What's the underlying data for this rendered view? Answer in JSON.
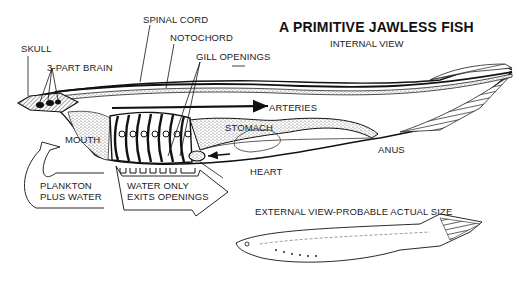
{
  "title": "A PRIMITIVE JAWLESS FISH",
  "subtitle": "INTERNAL VIEW",
  "labels": {
    "spinal_cord": "SPINAL CORD",
    "notochord": "NOTOCHORD",
    "skull": "SKULL",
    "brain": "3-PART BRAIN",
    "gill_openings": "GILL OPENINGS",
    "arteries": "ARTERIES",
    "mouth": "MOUTH",
    "stomach": "STOMACH",
    "heart": "HEART",
    "anus": "ANUS",
    "plankton_line1": "PLANKTON",
    "plankton_line2": "PLUS WATER",
    "water_line1": "WATER ONLY",
    "water_line2": "EXITS OPENINGS",
    "external_view": "EXTERNAL VIEW-PROBABLE ACTUAL SIZE"
  },
  "colors": {
    "ink": "#1a1a1a",
    "background": "#ffffff",
    "stipple": "#777777"
  }
}
